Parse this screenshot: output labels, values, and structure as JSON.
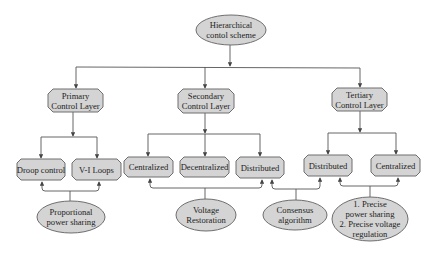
{
  "diagram": {
    "type": "hierarchy",
    "colors": {
      "node_fill": "#d4d4d4",
      "node_stroke": "#6e6e6e",
      "edge": "#555555",
      "text": "#222222",
      "background": "#ffffff"
    },
    "root": {
      "id": "root",
      "shape": "ellipse",
      "lines": [
        "Hierarchical",
        "contol scheme"
      ]
    },
    "layers": [
      {
        "id": "primary",
        "lines": [
          "Primary",
          "Control Layer"
        ],
        "children": [
          {
            "id": "droop",
            "label": "Droop control"
          },
          {
            "id": "vi",
            "label": "V-I Loops"
          }
        ],
        "goal": {
          "id": "proportional",
          "lines": [
            "Proportional",
            "power sharing"
          ]
        }
      },
      {
        "id": "secondary",
        "lines": [
          "Secondary",
          "Control Layer"
        ],
        "children": [
          {
            "id": "sec-centralized",
            "label": "Centralized"
          },
          {
            "id": "sec-decentralized",
            "label": "Decentralized"
          },
          {
            "id": "sec-distributed",
            "label": "Distributed"
          }
        ],
        "goal": {
          "id": "voltage",
          "lines": [
            "Voltage",
            "Restoration"
          ]
        }
      },
      {
        "id": "tertiary",
        "lines": [
          "Tertiary",
          "Control Layer"
        ],
        "children": [
          {
            "id": "ter-distributed",
            "label": "Distributed"
          },
          {
            "id": "ter-centralized",
            "label": "Centralized"
          }
        ],
        "goal": {
          "id": "precise",
          "lines": [
            "1. Precise",
            "power sharing",
            "2. Precise voltage",
            "regulation"
          ]
        }
      }
    ],
    "shared": {
      "id": "consensus",
      "lines": [
        "Consensus",
        "algorithm"
      ],
      "links": [
        "sec-distributed",
        "ter-distributed"
      ]
    }
  }
}
